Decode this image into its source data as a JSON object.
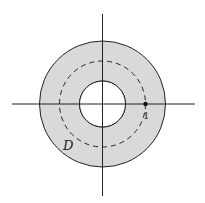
{
  "diagram": {
    "colors": {
      "region_fill": "#d9d9d9",
      "stroke": "#222222",
      "background": "#ffffff"
    },
    "region_label": "D",
    "point_label": "1",
    "center": {
      "x": 102.5,
      "y": 104
    },
    "outer_radius": 63,
    "inner_radius": 23,
    "dashed_radius": 43,
    "axes": {
      "x_from": 12,
      "x_to": 195,
      "y_from": 14,
      "y_to": 196
    }
  }
}
